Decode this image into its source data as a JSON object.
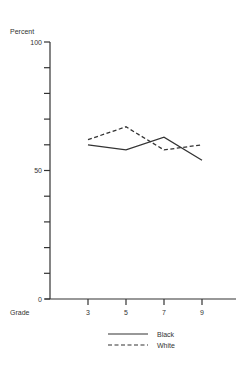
{
  "chart_data": {
    "type": "line",
    "title": "",
    "ylabel": "Percent",
    "xlabel": "Grade",
    "ylim": [
      0,
      100
    ],
    "y_ticks": [
      0,
      10,
      20,
      30,
      40,
      50,
      60,
      70,
      80,
      90,
      100
    ],
    "y_tick_labels": [
      {
        "value": 0,
        "label": "0"
      },
      {
        "value": 50,
        "label": "50"
      },
      {
        "value": 100,
        "label": "100"
      }
    ],
    "x": [
      3,
      5,
      7,
      9
    ],
    "x_tick_labels": [
      "3",
      "5",
      "7",
      "9"
    ],
    "xlim": [
      2,
      10.5
    ],
    "grid": false,
    "legend_position": "bottom",
    "series": [
      {
        "name": "Black",
        "style": "solid",
        "values": [
          60,
          58,
          63,
          54
        ]
      },
      {
        "name": "White",
        "style": "dashed",
        "values": [
          62,
          67,
          58,
          60
        ]
      }
    ],
    "colors": {
      "line": "#333333",
      "axis": "#333333"
    }
  }
}
